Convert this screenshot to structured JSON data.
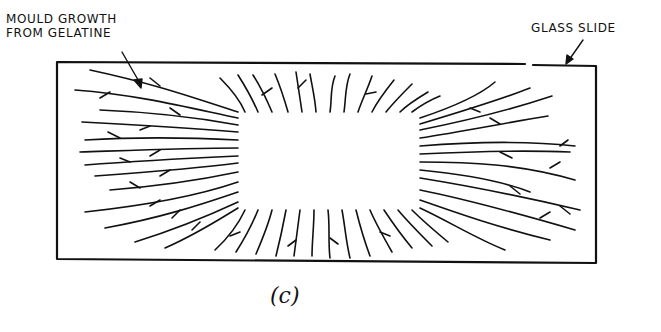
{
  "figure": {
    "labels": {
      "mould_growth_line1": "MOULD GROWTH",
      "mould_growth_line2": "FROM GELATINE",
      "glass_slide": "GLASS SLIDE"
    },
    "caption": "(c)",
    "colors": {
      "ink": "#111111",
      "background": "#ffffff"
    }
  }
}
